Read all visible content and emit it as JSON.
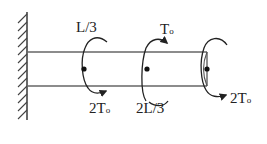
{
  "diagram": {
    "colors": {
      "line": "#555555",
      "ink": "#222222",
      "background": "#ffffff"
    },
    "labels": {
      "pos1": "L/3",
      "pos2": "2L/3",
      "torque_top": "T",
      "torque_top_sub": "o",
      "torque1": "2T",
      "torque1_sub": "o",
      "torque_end": "2T",
      "torque_end_sub": "o"
    },
    "elements": {
      "support": "fixed-wall",
      "shaft": "circular-bar",
      "torques": [
        {
          "position": "L/3",
          "magnitude": "2To"
        },
        {
          "position": "2L/3",
          "magnitude": "To"
        },
        {
          "position": "L",
          "magnitude": "2To"
        }
      ]
    }
  }
}
